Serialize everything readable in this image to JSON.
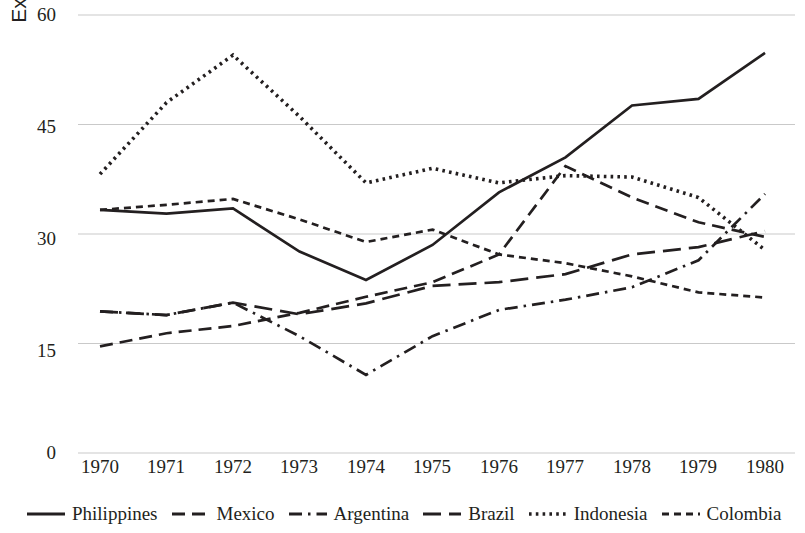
{
  "chart_data": {
    "type": "line",
    "title": "",
    "xlabel": "",
    "ylabel": "External debt (% GNI)",
    "x": [
      1970,
      1971,
      1972,
      1973,
      1974,
      1975,
      1976,
      1977,
      1978,
      1979,
      1980
    ],
    "xticklabels": [
      "1970",
      "1971",
      "1972",
      "1973",
      "1974",
      "1975",
      "1976",
      "1977",
      "1978",
      "1979",
      "1980"
    ],
    "yticklabels": [
      "0",
      "15",
      "30",
      "45",
      "60"
    ],
    "ylim": [
      0,
      60
    ],
    "yticks": [
      0,
      15,
      30,
      45,
      60
    ],
    "grid": "horizontal",
    "legend_position": "bottom",
    "series": [
      {
        "name": "Philippines",
        "style": "solid",
        "color": "#231f20",
        "values": [
          33.3,
          32.8,
          33.5,
          27.6,
          23.7,
          28.5,
          35.7,
          40.5,
          47.6,
          48.5,
          54.8
        ]
      },
      {
        "name": "Mexico",
        "style": "dashed",
        "color": "#231f20",
        "values": [
          14.6,
          16.4,
          17.4,
          19.2,
          21.4,
          23.4,
          27.2,
          39.3,
          35.0,
          31.6,
          29.6
        ]
      },
      {
        "name": "Argentina",
        "style": "dash-dot",
        "color": "#231f20",
        "values": [
          19.4,
          18.9,
          20.6,
          16.0,
          10.7,
          16.0,
          19.6,
          21.0,
          22.7,
          26.4,
          35.5
        ]
      },
      {
        "name": "Brazil",
        "style": "long-dash",
        "color": "#231f20",
        "values": [
          19.4,
          18.9,
          20.6,
          19.0,
          20.5,
          22.9,
          23.4,
          24.5,
          27.2,
          28.2,
          30.4
        ]
      },
      {
        "name": "Indonesia",
        "style": "dotted",
        "color": "#231f20",
        "values": [
          38.2,
          48.0,
          54.5,
          46.1,
          37.0,
          39.0,
          37.0,
          38.0,
          37.8,
          35.0,
          27.8
        ]
      },
      {
        "name": "Colombia",
        "style": "short-dash",
        "color": "#231f20",
        "values": [
          33.3,
          34.0,
          34.8,
          32.0,
          28.9,
          30.6,
          27.2,
          26.0,
          24.2,
          22.0,
          21.3
        ]
      }
    ]
  },
  "axes": {
    "y_ticks": [
      {
        "label": "60"
      },
      {
        "label": "45"
      },
      {
        "label": "30"
      },
      {
        "label": "15"
      },
      {
        "label": "0"
      }
    ],
    "x_ticks": [
      {
        "label": "1970"
      },
      {
        "label": "1971"
      },
      {
        "label": "1972"
      },
      {
        "label": "1973"
      },
      {
        "label": "1974"
      },
      {
        "label": "1975"
      },
      {
        "label": "1976"
      },
      {
        "label": "1977"
      },
      {
        "label": "1978"
      },
      {
        "label": "1979"
      },
      {
        "label": "1980"
      }
    ],
    "ylabel": "External debt (% GNI)"
  },
  "legend": {
    "items": [
      {
        "label": "Philippines"
      },
      {
        "label": "Mexico"
      },
      {
        "label": "Argentina"
      },
      {
        "label": "Brazil"
      },
      {
        "label": "Indonesia"
      },
      {
        "label": "Colombia"
      }
    ]
  },
  "colors": {
    "ink": "#231f20",
    "grid": "#c9c9c9",
    "background": "#ffffff"
  }
}
